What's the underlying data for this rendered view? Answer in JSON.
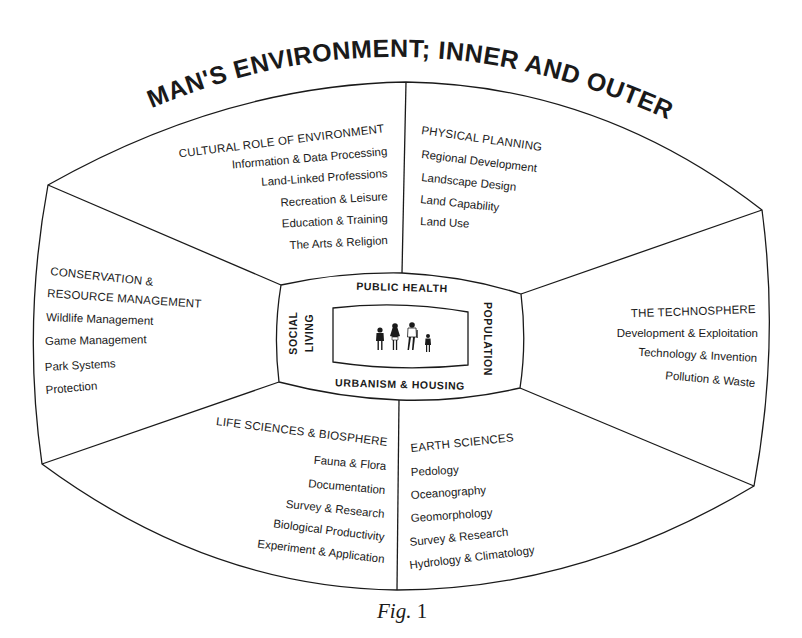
{
  "title": "MAN'S ENVIRONMENT; INNER AND OUTER",
  "caption": {
    "prefix": "Fig.",
    "number": "1"
  },
  "sections": {
    "cultural": {
      "heading": "CULTURAL ROLE OF ENVIRONMENT",
      "items": [
        "Information & Data Processing",
        "Land-Linked Professions",
        "Recreation & Leisure",
        "Education & Training",
        "The Arts & Religion"
      ]
    },
    "physical": {
      "heading": "PHYSICAL PLANNING",
      "items": [
        "Regional Development",
        "Landscape Design",
        "Land Capability",
        "Land Use"
      ]
    },
    "conservation": {
      "heading_line1": "CONSERVATION &",
      "heading_line2": "RESOURCE MANAGEMENT",
      "items": [
        "Wildlife Management",
        "Game Management",
        "Park Systems",
        "Protection"
      ]
    },
    "technosphere": {
      "heading": "THE TECHNOSPHERE",
      "items": [
        "Development & Exploitation",
        "Technology & Invention",
        "Pollution & Waste"
      ]
    },
    "life_sciences": {
      "heading": "LIFE SCIENCES & BIOSPHERE",
      "items": [
        "Fauna & Flora",
        "Documentation",
        "Survey & Research",
        "Biological Productivity",
        "Experiment & Application"
      ]
    },
    "earth_sciences": {
      "heading": "EARTH SCIENCES",
      "items": [
        "Pedology",
        "Oceanography",
        "Geomorphology",
        "Survey & Research",
        "Hydrology & Climatology"
      ]
    }
  },
  "inner": {
    "top": "PUBLIC HEALTH",
    "bottom": "URBANISM & HOUSING",
    "left_line1": "SOCIAL",
    "left_line2": "LIVING",
    "right": "POPULATION",
    "center_icon": "family-figures-icon"
  }
}
